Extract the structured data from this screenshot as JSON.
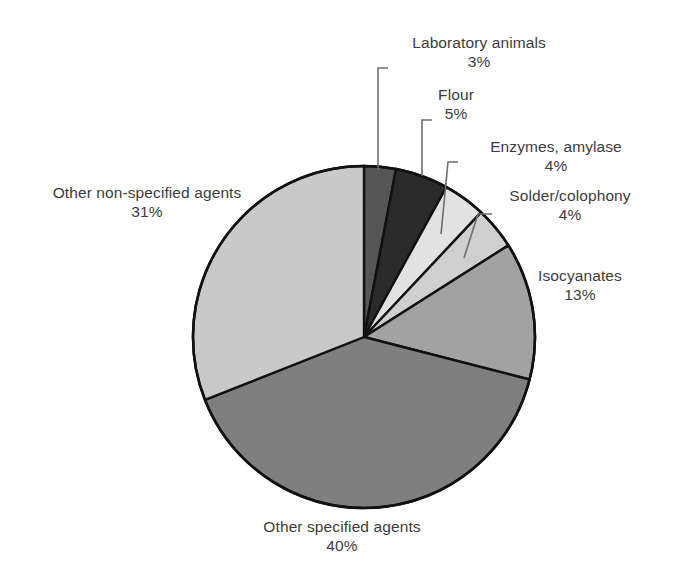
{
  "chart_data": {
    "type": "pie",
    "title": "",
    "subtitle": "",
    "xlabel": "",
    "ylabel": "",
    "legend_position": "none",
    "grid": false,
    "labels_show_percent": true,
    "start_angle_deg": 0,
    "direction": "clockwise",
    "categories": [
      "Laboratory animals",
      "Flour",
      "Enzymes, amylase",
      "Solder/colophony",
      "Isocyanates",
      "Other specified agents",
      "Other non-specified agents"
    ],
    "values": [
      3,
      5,
      4,
      4,
      13,
      40,
      31
    ],
    "value_labels": [
      "3%",
      "5%",
      "4%",
      "4%",
      "13%",
      "40%",
      "31%"
    ],
    "colors": [
      "#555555",
      "#2b2b2b",
      "#e2e2e2",
      "#cfcfcf",
      "#a2a2a2",
      "#7f7f7f",
      "#c9c9c9"
    ],
    "slices": [
      {
        "label": "Laboratory animals",
        "value": 3,
        "value_label": "3%",
        "color": "#555555"
      },
      {
        "label": "Flour",
        "value": 5,
        "value_label": "5%",
        "color": "#2b2b2b"
      },
      {
        "label": "Enzymes, amylase",
        "value": 4,
        "value_label": "4%",
        "color": "#e2e2e2"
      },
      {
        "label": "Solder/colophony",
        "value": 4,
        "value_label": "4%",
        "color": "#cfcfcf"
      },
      {
        "label": "Isocyanates",
        "value": 13,
        "value_label": "13%",
        "color": "#a2a2a2"
      },
      {
        "label": "Other specified agents",
        "value": 40,
        "value_label": "40%",
        "color": "#7f7f7f"
      },
      {
        "label": "Other non-specified agents",
        "value": 31,
        "value_label": "31%",
        "color": "#c9c9c9"
      }
    ],
    "total_percent": "100%",
    "outline_color": "#111111",
    "background_color": "#ffffff"
  },
  "labels": {
    "lab_animals": {
      "name": "Laboratory animals",
      "pct": "3%"
    },
    "flour": {
      "name": "Flour",
      "pct": "5%"
    },
    "enzymes": {
      "name": "Enzymes, amylase",
      "pct": "4%"
    },
    "solder": {
      "name": "Solder/colophony",
      "pct": "4%"
    },
    "isocyanates": {
      "name": "Isocyanates",
      "pct": "13%"
    },
    "other_non": {
      "name": "Other non-specified agents",
      "pct": "31%"
    },
    "other_spec": {
      "name": "Other specified agents",
      "pct": "40%"
    }
  }
}
